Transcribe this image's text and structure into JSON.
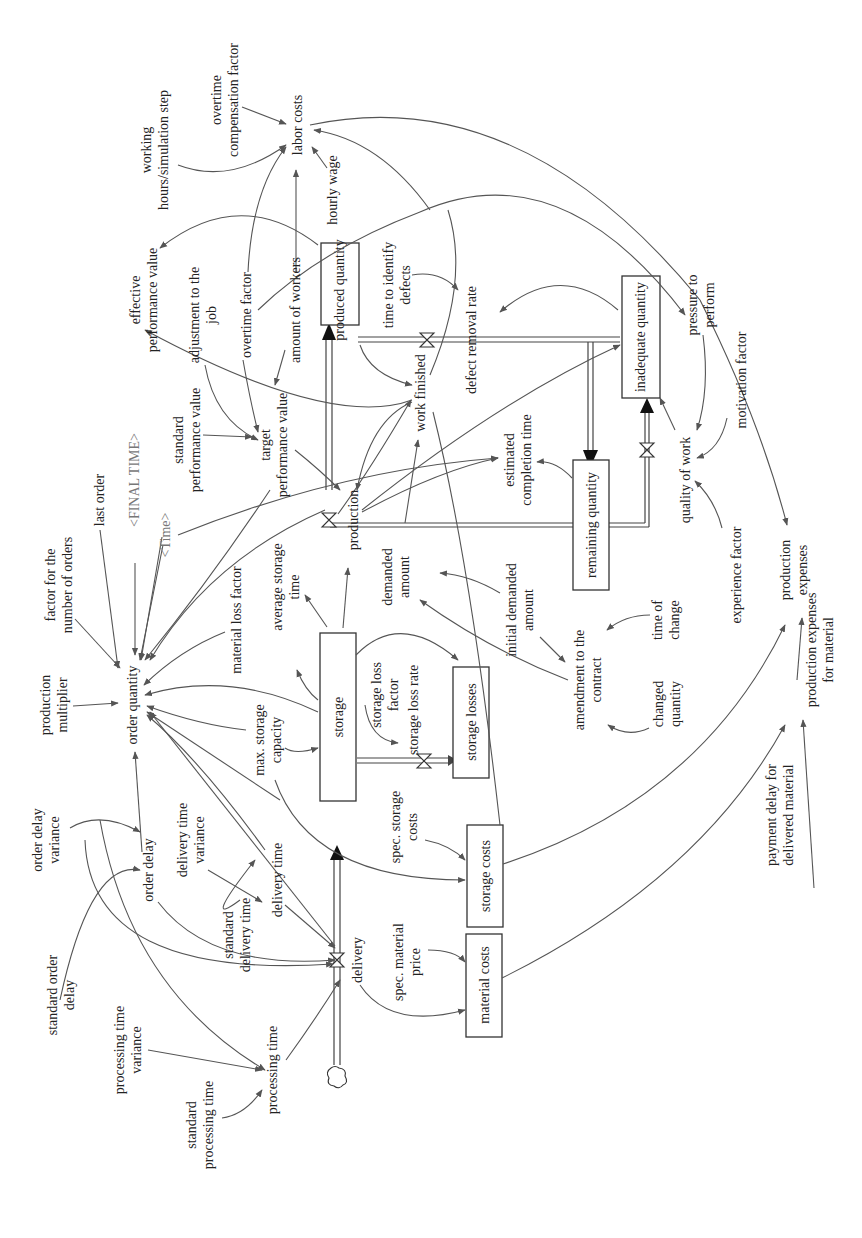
{
  "diagram": {
    "type": "system-dynamics stock-and-flow diagram",
    "orientation": "rotated 90 degrees counter-clockwise (text reads bottom-to-top)",
    "stocks": [
      {
        "id": "produced_quantity",
        "label": "produced quantity"
      },
      {
        "id": "inadequate_quantity",
        "label": "inadequate quantity"
      },
      {
        "id": "remaining_quantity",
        "label": "remaining quantity"
      },
      {
        "id": "storage",
        "label": "storage"
      },
      {
        "id": "storage_losses",
        "label": "storage losses"
      },
      {
        "id": "storage_costs",
        "label": "storage costs"
      },
      {
        "id": "material_costs",
        "label": "material costs"
      }
    ],
    "flows": [
      {
        "id": "delivery",
        "label": "delivery"
      },
      {
        "id": "production",
        "label": "production"
      },
      {
        "id": "defect_removal_rate",
        "label": "defect removal rate"
      },
      {
        "id": "storage_loss_rate",
        "label": "storage loss rate"
      }
    ],
    "variables": {
      "labor_costs": "labor costs",
      "overtime_compensation_factor": [
        "overtime",
        "compensation factor"
      ],
      "working_hours": [
        "working",
        "hours/simulation step"
      ],
      "hourly_wage": "hourly wage",
      "effective_performance_value": [
        "effective",
        "performance value"
      ],
      "adjustment_to_the_job": [
        "adjustment to the",
        "job"
      ],
      "overtime_factor": "overtime factor",
      "amount_of_workers": "amount of workers",
      "time_to_identify_defects": [
        "time to identify",
        "defects"
      ],
      "pressure_to_perform": [
        "pressure to",
        "perform"
      ],
      "motivation_factor": "motivation factor",
      "quality_of_work": "quality of work",
      "experience_factor": "experience factor",
      "production_expenses": [
        "production",
        "expenses"
      ],
      "production_expenses_for_material": [
        "production expenses",
        "for material"
      ],
      "payment_delay_for_delivered_material": [
        "payment delay for",
        "delivered material"
      ],
      "work_finished": "work finished",
      "estimated_completion_time": [
        "estimated",
        "completion time"
      ],
      "standard_performance_value": [
        "standard",
        "performance value"
      ],
      "target_performance_value": [
        "target",
        "performance value"
      ],
      "final_time": "<FINAL TIME>",
      "time": "<Time>",
      "last_order": "last order",
      "factor_for_number_of_orders": [
        "factor for the",
        "number of orders"
      ],
      "production_multiplier": [
        "production",
        "multiplier"
      ],
      "order_quantity": "order quantity",
      "material_loss_factor": "material loss factor",
      "average_storage_time": [
        "average storage",
        "time"
      ],
      "demanded_amount": [
        "demanded",
        "amount"
      ],
      "initial_demanded_amount": [
        "initial demanded",
        "amount"
      ],
      "amendment_to_the_contract": [
        "amendment to the",
        "contract"
      ],
      "time_of_change": [
        "time of",
        "change"
      ],
      "changed_quantity": [
        "changed",
        "quantity"
      ],
      "storage_loss_factor": [
        "storage loss",
        "factor"
      ],
      "max_storage_capacity": [
        "max. storage",
        "capacity"
      ],
      "spec_storage_costs": [
        "spec. storage",
        "costs"
      ],
      "spec_material_price": [
        "spec. material",
        "price"
      ],
      "order_delay_variance": [
        "order delay",
        "variance"
      ],
      "order_delay": "order delay",
      "delivery_time_variance": [
        "delivery time",
        "variance"
      ],
      "delivery_time": "delivery time",
      "standard_delivery_time": [
        "standard",
        "delivery time"
      ],
      "standard_order_delay": [
        "standard order",
        "delay"
      ],
      "processing_time_variance": [
        "processing time",
        "variance"
      ],
      "processing_time": "processing time",
      "standard_processing_time": [
        "standard",
        "processing time"
      ]
    }
  }
}
